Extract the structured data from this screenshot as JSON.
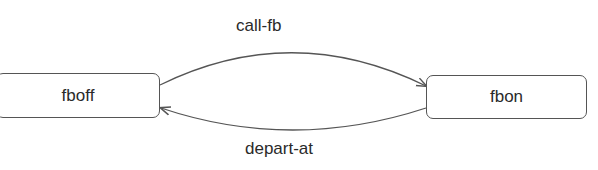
{
  "diagram": {
    "type": "state-transition",
    "states": [
      {
        "id": "fboff",
        "label": "fboff"
      },
      {
        "id": "fbon",
        "label": "fbon"
      }
    ],
    "transitions": [
      {
        "from": "fboff",
        "to": "fbon",
        "label": "call-fb"
      },
      {
        "from": "fbon",
        "to": "fboff",
        "label": "depart-at"
      }
    ],
    "colors": {
      "stroke": "#555555",
      "text": "#2a2a2a",
      "background": "#ffffff"
    }
  }
}
